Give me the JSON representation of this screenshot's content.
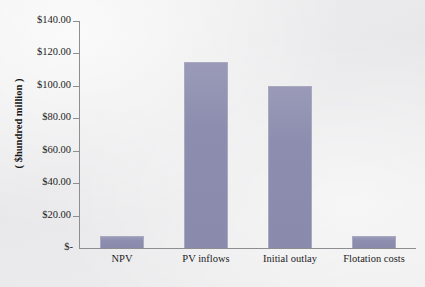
{
  "chart_data": {
    "type": "bar",
    "title": "",
    "subtitle": "",
    "xlabel": "",
    "ylabel": "( $hundred million )",
    "categories": [
      "NPV",
      "PV inflows",
      "Initial outlay",
      "Flotation costs"
    ],
    "values": [
      7.5,
      115.0,
      100.0,
      7.5
    ],
    "series": [
      {
        "name": "",
        "values": [
          7.5,
          115.0,
          100.0,
          7.5
        ]
      }
    ],
    "ylim": [
      0,
      140
    ],
    "y_ticks": [
      0,
      20,
      40,
      60,
      80,
      100,
      120,
      140
    ],
    "y_tick_labels": [
      "$-",
      "$20.00",
      "$40.00",
      "$60.00",
      "$80.00",
      "$100.00",
      "$120.00",
      "$140.00"
    ],
    "grid": false,
    "legend": false,
    "legend_position": "none",
    "bar_color": "#8d8daf",
    "bar_border_color": "#a9a9c0",
    "axis_color": "#8e8e92",
    "background_color": "#ececed",
    "text_color": "#1c1c1c"
  },
  "axis": {
    "y_title": "( $hundred million )",
    "zero_label": "$-",
    "ticks": [
      {
        "label": "$140.00",
        "value": 140
      },
      {
        "label": "$120.00",
        "value": 120
      },
      {
        "label": "$100.00",
        "value": 100
      },
      {
        "label": "$80.00",
        "value": 80
      },
      {
        "label": "$60.00",
        "value": 60
      },
      {
        "label": "$40.00",
        "value": 40
      },
      {
        "label": "$20.00",
        "value": 20
      }
    ]
  },
  "bars": [
    {
      "label": "NPV",
      "value": 7.5
    },
    {
      "label": "PV inflows",
      "value": 115.0
    },
    {
      "label": "Initial outlay",
      "value": 100.0
    },
    {
      "label": "Flotation costs",
      "value": 7.5
    }
  ]
}
